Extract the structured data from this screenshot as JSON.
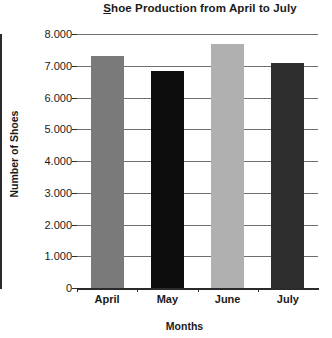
{
  "chart_data": {
    "type": "bar",
    "title": "Shoe Production from April to July",
    "xlabel": "Months",
    "ylabel": "Number of Shoes",
    "categories": [
      "April",
      "May",
      "June",
      "July"
    ],
    "values": [
      7300,
      6850,
      7700,
      7100
    ],
    "bar_colors": [
      "#7a7a7a",
      "#0d0d0d",
      "#b0b0b0",
      "#2e2e2e"
    ],
    "ylim": [
      0,
      8000
    ],
    "ytick_values": [
      8000,
      7000,
      6000,
      5000,
      4000,
      3000,
      2000,
      1000,
      0
    ],
    "ytick_labels": [
      "8.000",
      "7.000",
      "6.000",
      "5.000",
      "4.000",
      "3.000",
      "2.000",
      "1.000",
      "0"
    ],
    "grid": true,
    "legend": false,
    "legend_position": "none"
  },
  "title_parts": {
    "underlined": "S",
    "rest": "hoe Production from April to July"
  }
}
